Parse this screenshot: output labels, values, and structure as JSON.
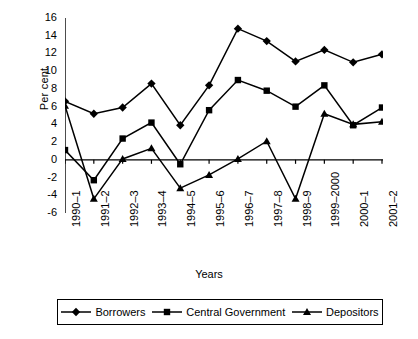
{
  "chart_data": {
    "type": "line",
    "title": "",
    "xlabel": "Years",
    "ylabel": "Per cent",
    "categories": [
      "1990–1",
      "1991–2",
      "1992–3",
      "1993–4",
      "1994–5",
      "1995–6",
      "1996–7",
      "1997–8",
      "1998–9",
      "1999–2000",
      "2000–1",
      "2001–2"
    ],
    "ylim": [
      -6,
      16
    ],
    "yticks": [
      16,
      14,
      12,
      10,
      8,
      6,
      4,
      2,
      0,
      -2,
      -4,
      -6
    ],
    "grid": false,
    "legend_position": "bottom",
    "series": [
      {
        "name": "Borrowers",
        "marker": "diamond",
        "values": [
          6.6,
          5.2,
          5.9,
          8.6,
          3.9,
          8.4,
          14.8,
          13.4,
          11.1,
          12.4,
          11.0,
          11.9
        ]
      },
      {
        "name": "Central Government",
        "marker": "square",
        "values": [
          1.1,
          -2.3,
          2.4,
          4.2,
          -0.5,
          5.6,
          9.0,
          7.8,
          6.0,
          8.4,
          3.9,
          5.9
        ]
      },
      {
        "name": "Depositors",
        "marker": "triangle",
        "values": [
          6.1,
          -4.4,
          0.1,
          1.3,
          -3.2,
          -1.7,
          0.1,
          2.1,
          -4.4,
          5.2,
          4.0,
          4.3
        ]
      }
    ],
    "colors": {
      "line": "#000000",
      "marker": "#000000",
      "axis": "#000000",
      "background": "#ffffff"
    }
  },
  "legend": {
    "items": [
      {
        "label": "Borrowers",
        "marker": "diamond"
      },
      {
        "label": "Central Government",
        "marker": "square"
      },
      {
        "label": "Depositors",
        "marker": "triangle"
      }
    ]
  }
}
